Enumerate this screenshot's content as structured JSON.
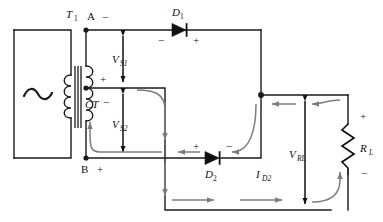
{
  "diagram": {
    "type": "circuit-schematic",
    "colors": {
      "wire": "#1a1a1a",
      "current_path": "#7d7d7d",
      "background": "#ffffff",
      "text": "#111111"
    }
  },
  "components": {
    "source": {
      "name": "ac-source",
      "symbol": "~"
    },
    "transformer": {
      "name": "transformer",
      "label": "T",
      "subscript": "1"
    },
    "terminal_a": {
      "label": "A",
      "polarity": "−"
    },
    "terminal_b": {
      "label": "B",
      "polarity": "+"
    },
    "center_tap": {
      "label": "CT",
      "polarity_upper": "+",
      "polarity_lower": "−"
    },
    "diode1": {
      "label": "D",
      "subscript": "1",
      "anode_sign": "−",
      "cathode_sign": "+"
    },
    "diode2": {
      "label": "D",
      "subscript": "2",
      "anode_sign": "+",
      "cathode_sign": "−"
    },
    "load": {
      "label": "R",
      "subscript": "L",
      "polarity_top": "+",
      "polarity_bottom": "−"
    }
  },
  "measurements": {
    "vs1": {
      "label": "V",
      "subscript": "S1"
    },
    "vs2": {
      "label": "V",
      "subscript": "S2"
    },
    "vrl": {
      "label": "V",
      "subscript": "RL"
    },
    "id2": {
      "label": "I",
      "subscript": "D2"
    }
  }
}
